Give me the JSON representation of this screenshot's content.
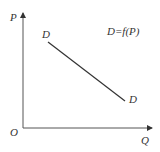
{
  "diagram": {
    "type": "demand-curve",
    "axes": {
      "y_label": "P",
      "x_label": "Q",
      "origin_label": "O"
    },
    "curve": {
      "start_label": "D",
      "end_label": "D",
      "equation": "D=f(P)"
    },
    "colors": {
      "line": "#333333",
      "axis": "#555555",
      "background": "#ffffff"
    }
  }
}
